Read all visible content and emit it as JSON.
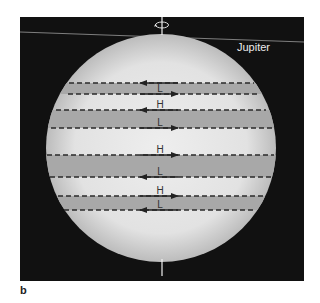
{
  "figure": {
    "panel_label": "b",
    "planet_name": "Jupiter",
    "colors": {
      "background": "#111111",
      "planet_light": "#e6e6e6",
      "planet_edge": "#bdbdbd",
      "band_dark": "#a8a8a8",
      "line": "#2a2a2a",
      "axis": "#f2f2f2"
    },
    "rotation_axis": {
      "symbol": "rotation-arrow",
      "top_y": 17,
      "bottom_y": 276
    },
    "band_lines": [
      {
        "y": 83,
        "x1": 69,
        "x2": 254,
        "label": "",
        "direction": "left"
      },
      {
        "y": 94,
        "x1": 68,
        "x2": 258,
        "label": "L",
        "direction": "right"
      },
      {
        "y": 110,
        "x1": 56,
        "x2": 266,
        "label": "H",
        "direction": "left"
      },
      {
        "y": 128,
        "x1": 51,
        "x2": 274,
        "label": "L",
        "direction": "right"
      },
      {
        "y": 155,
        "x1": 47,
        "x2": 274,
        "label": "H",
        "direction": "right"
      },
      {
        "y": 177,
        "x1": 50,
        "x2": 272,
        "label": "L",
        "direction": "left"
      },
      {
        "y": 196,
        "x1": 58,
        "x2": 264,
        "label": "H",
        "direction": "right"
      },
      {
        "y": 210,
        "x1": 64,
        "x2": 256,
        "label": "L",
        "direction": "left"
      }
    ],
    "dark_bands": [
      {
        "y1": 83,
        "y2": 94
      },
      {
        "y1": 110,
        "y2": 128
      },
      {
        "y1": 155,
        "y2": 177
      },
      {
        "y1": 196,
        "y2": 210
      }
    ]
  }
}
